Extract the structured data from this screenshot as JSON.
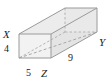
{
  "figure": {
    "name": "rectangular-prism-diagram",
    "shape": "rectangular prism",
    "projection": "oblique",
    "colors": {
      "edge": "#9a9a9a",
      "hidden_edge": "#b0b0b0",
      "face_front": "#f2f2f2",
      "face_top": "#ebebeb",
      "face_right": "#e3e3e3",
      "label": "#1a1a1a",
      "background": "#ffffff"
    },
    "vertex_labels": [
      {
        "id": "X",
        "text": "X",
        "position": "left"
      },
      {
        "id": "Y",
        "text": "Y",
        "position": "right"
      },
      {
        "id": "Z",
        "text": "Z",
        "position": "bottom-center"
      }
    ],
    "dimension_labels": [
      {
        "id": "height",
        "text": "4",
        "position": "left"
      },
      {
        "id": "width",
        "text": "5",
        "position": "bottom-left"
      },
      {
        "id": "length",
        "text": "9",
        "position": "bottom-right"
      }
    ],
    "diagonal": {
      "from": "X",
      "to": "Y",
      "style": "dashed"
    }
  }
}
